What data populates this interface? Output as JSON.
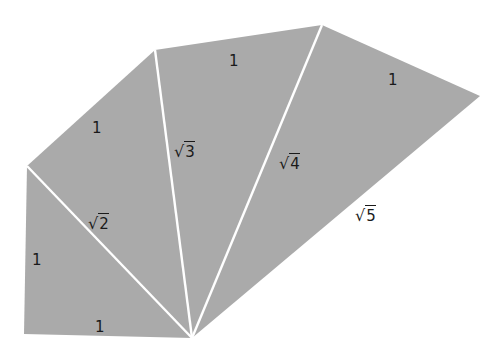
{
  "diagram": {
    "colors": {
      "fill": "#aaaaaa",
      "edge": "#ffffff",
      "text": "#1a1a1a",
      "background": "#ffffff"
    },
    "vertices": {
      "O": [
        192,
        338
      ],
      "A": [
        24,
        334
      ],
      "B": [
        27,
        166
      ],
      "C": [
        155,
        50
      ],
      "D": [
        322,
        25
      ],
      "E": [
        480,
        96
      ]
    },
    "triangles": [
      {
        "points": "192,338 24,334 27,166"
      },
      {
        "points": "192,338 27,166 155,50"
      },
      {
        "points": "192,338 155,50 322,25"
      },
      {
        "points": "192,338 322,25 480,96"
      }
    ],
    "spokes": [
      {
        "from": [
          192,
          338
        ],
        "to": [
          27,
          166
        ]
      },
      {
        "from": [
          192,
          338
        ],
        "to": [
          155,
          50
        ]
      },
      {
        "from": [
          192,
          338
        ],
        "to": [
          322,
          25
        ]
      }
    ],
    "labels": {
      "bottom_leg": "1",
      "left_leg": "1",
      "outer_1": "1",
      "outer_2": "1",
      "outer_3": "1",
      "hyp_2": {
        "radical": "√",
        "radicand": "2"
      },
      "hyp_3": {
        "radical": "√",
        "radicand": "3"
      },
      "hyp_4": {
        "radical": "√",
        "radicand": "4"
      },
      "hyp_5": {
        "radical": "√",
        "radicand": "5"
      }
    }
  }
}
